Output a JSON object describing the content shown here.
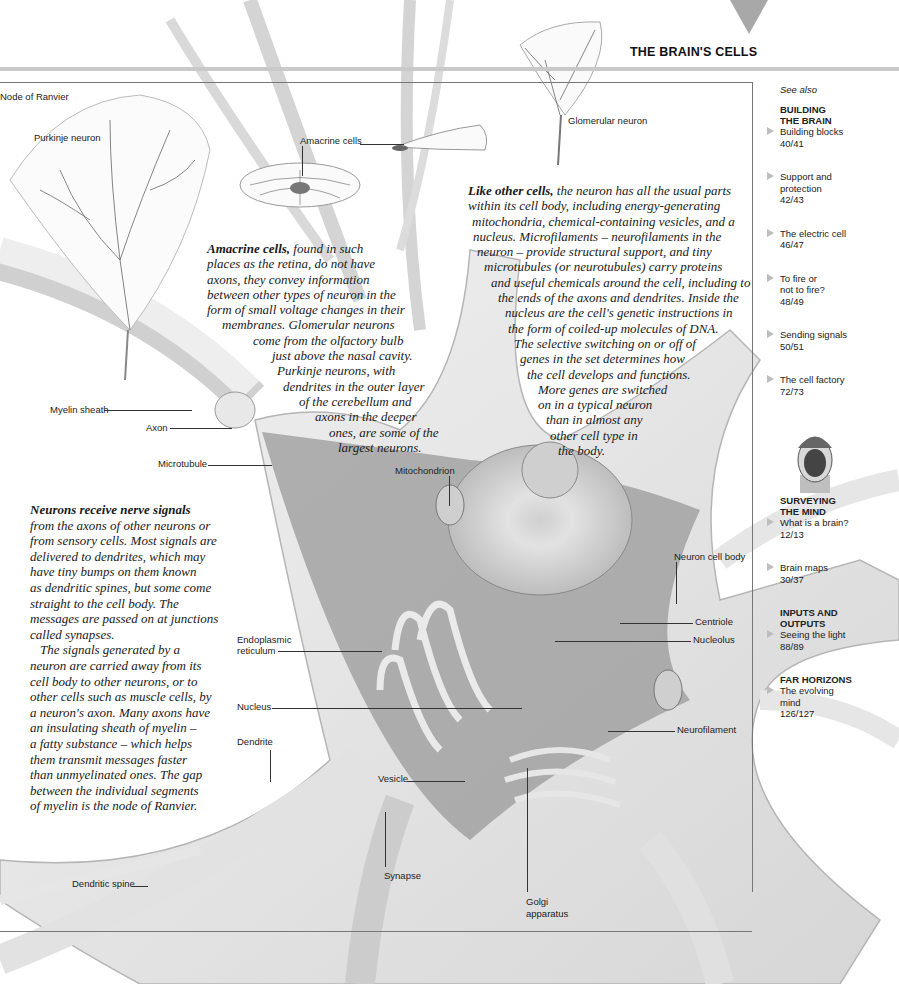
{
  "header": {
    "section_title": "THE BRAIN'S CELLS",
    "marker_color": "#a8a8a8"
  },
  "labels": {
    "node_of_ranvier": "Node of Ranvier",
    "purkinje_neuron": "Purkinje neuron",
    "amacrine_cells": "Amacrine cells",
    "glomerular_neuron": "Glomerular neuron",
    "myelin_sheath": "Myelin sheath",
    "axon": "Axon",
    "microtubule": "Microtubule",
    "mitochondrion": "Mitochondrion",
    "neuron_cell_body": "Neuron cell body",
    "centriole": "Centriole",
    "nucleolus": "Nucleolus",
    "endoplasmic_reticulum_1": "Endoplasmic",
    "endoplasmic_reticulum_2": "reticulum",
    "nucleus": "Nucleus",
    "neurofilament": "Neurofilament",
    "dendrite": "Dendrite",
    "vesicle": "Vesicle",
    "synapse": "Synapse",
    "golgi_1": "Golgi",
    "golgi_2": "apparatus",
    "dendritic_spine": "Dendritic spine"
  },
  "amacrine_text": {
    "lead": "Amacrine cells,",
    "lines": [
      " found in such",
      "places as the retina, do not have",
      "axons, they convey information",
      "between other types of neuron in the",
      "form of small voltage changes in their",
      "membranes. Glomerular neurons",
      "come from the olfactory bulb",
      "just above the nasal cavity.",
      "Purkinje neurons, with",
      "dendrites in the outer layer",
      "of the cerebellum and",
      "axons in the deeper",
      "ones, are some of the",
      "largest neurons."
    ]
  },
  "cells_text": {
    "lead": "Like other cells,",
    "lines": [
      " the neuron has all the usual parts",
      "within its cell body, including energy-generating",
      "mitochondria, chemical-containing vesicles, and a",
      "nucleus. Microfilaments – neurofilaments in the",
      "neuron – provide structural support, and tiny",
      "microtubules (or neurotubules) carry proteins",
      "and useful chemicals around the cell, including to",
      "the ends of the axons and dendrites. Inside the",
      "nucleus are the cell's genetic instructions in",
      "the form of coiled-up molecules of DNA.",
      "The selective switching on or off of",
      "genes in the set determines how",
      "the cell develops and functions.",
      "More genes are switched",
      "on in a typical neuron",
      "than in almost any",
      "other cell type in",
      "the body."
    ]
  },
  "signals_text": {
    "lead": "Neurons receive nerve signals",
    "lines": [
      "from the axons of other neurons or",
      "from sensory cells. Most signals are",
      "delivered to dendrites, which may",
      "have tiny bumps on them known",
      "as dendritic spines, but some come",
      "straight to the cell body. The",
      "messages are passed on at junctions",
      "called synapses.",
      "   The signals generated by a",
      "neuron are carried away from its",
      "cell body to other neurons, or to",
      "other cells such as muscle cells, by",
      "a neuron's axon. Many axons have",
      "an insulating sheath of myelin –",
      "a fatty substance – which helps",
      "them transmit messages faster",
      "than unmyelinated ones. The gap",
      "between the individual segments",
      "of myelin is the node of Ranvier."
    ]
  },
  "sidebar": {
    "see_also": "See also",
    "groups": [
      {
        "category": [
          "BUILDING",
          "THE BRAIN"
        ],
        "entries": [
          {
            "title": [
              "Building blocks"
            ],
            "pages": "40/41"
          },
          {
            "title": [
              "Support and",
              "protection"
            ],
            "pages": "42/43"
          },
          {
            "title": [
              "The electric cell"
            ],
            "pages": "46/47"
          },
          {
            "title": [
              "To fire or",
              "not to fire?"
            ],
            "pages": "48/49"
          },
          {
            "title": [
              "Sending signals"
            ],
            "pages": "50/51"
          },
          {
            "title": [
              "The cell factory"
            ],
            "pages": "72/73"
          }
        ]
      },
      {
        "category": [
          "SURVEYING",
          "THE MIND"
        ],
        "entries": [
          {
            "title": [
              "What is a brain?"
            ],
            "pages": "12/13"
          },
          {
            "title": [
              "Brain maps"
            ],
            "pages": "30/37"
          }
        ]
      },
      {
        "category": [
          "INPUTS AND",
          "OUTPUTS"
        ],
        "entries": [
          {
            "title": [
              "Seeing the light"
            ],
            "pages": "88/89"
          }
        ]
      },
      {
        "category": [
          "FAR HORIZONS"
        ],
        "entries": [
          {
            "title": [
              "The evolving",
              "mind"
            ],
            "pages": "126/127"
          }
        ]
      }
    ]
  },
  "icons": {
    "face_thumbnail": "head-icon",
    "arrow_marker": "triangle-right-icon"
  }
}
